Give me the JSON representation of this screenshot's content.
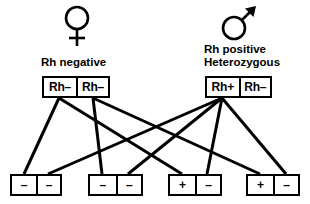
{
  "diagram": {
    "stroke_color": "#000000",
    "background_color": "#ffffff",
    "mother": {
      "symbol_name": "female-venus-symbol",
      "caption_lines": [
        "Rh negative"
      ],
      "caption_line1": "Rh negative",
      "alleles": [
        "Rh–",
        "Rh–"
      ]
    },
    "father": {
      "symbol_name": "male-mars-symbol",
      "caption_lines": [
        "Rh positive",
        "Heterozygous"
      ],
      "caption_line1": "Rh positive",
      "caption_line2": "Heterozygous",
      "alleles": [
        "Rh+",
        "Rh–"
      ]
    },
    "offspring": [
      {
        "id": "child-1",
        "alleles": [
          "–",
          "–"
        ]
      },
      {
        "id": "child-2",
        "alleles": [
          "–",
          "–"
        ]
      },
      {
        "id": "child-3",
        "alleles": [
          "+",
          "–"
        ]
      },
      {
        "id": "child-4",
        "alleles": [
          "+",
          "–"
        ]
      }
    ],
    "connections": [
      {
        "from": "mother-allele-1",
        "to": "child-1-slot-1"
      },
      {
        "from": "mother-allele-1",
        "to": "child-3-slot-1"
      },
      {
        "from": "mother-allele-2",
        "to": "child-2-slot-1"
      },
      {
        "from": "mother-allele-2",
        "to": "child-4-slot-1"
      },
      {
        "from": "father-allele-1",
        "to": "child-1-slot-2"
      },
      {
        "from": "father-allele-1",
        "to": "child-2-slot-2"
      },
      {
        "from": "father-allele-1",
        "to": "child-3-slot-2"
      },
      {
        "from": "father-allele-2",
        "to": "child-4-slot-2"
      }
    ]
  }
}
